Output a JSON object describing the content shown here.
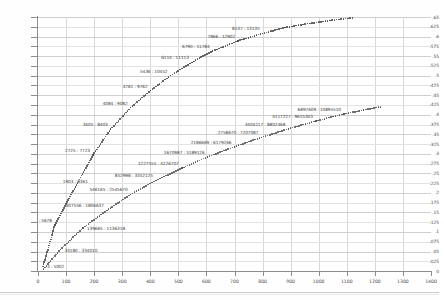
{
  "chart_data": {
    "type": "scatter",
    "title": "",
    "xlabel": "",
    "ylabel": "",
    "xlim": [
      0,
      1400
    ],
    "ylim": [
      0,
      0.65
    ],
    "grid": true,
    "legend": "none",
    "x_ticks": [
      0,
      100,
      200,
      300,
      400,
      500,
      600,
      700,
      800,
      900,
      1000,
      1100,
      1200,
      1300,
      1400
    ],
    "y_ticks": [
      "0",
      ".025",
      ".05",
      ".075",
      ".1",
      ".125",
      ".15",
      ".175",
      ".2",
      ".225",
      ".25",
      ".275",
      ".3",
      ".325",
      ".35",
      ".375",
      ".4",
      ".425",
      ".45",
      ".475",
      ".5",
      ".525",
      ".55",
      ".575",
      ".6",
      ".625",
      ".65"
    ],
    "series": [
      {
        "name": "upper-curve",
        "points": [
          {
            "x": 18,
            "y": 0.012,
            "label": "3 : 5002",
            "pos": "right"
          },
          {
            "x": 60,
            "y": 0.118,
            "label": "680 : 5678",
            "pos": "left"
          },
          {
            "x": 133,
            "y": 0.215,
            "label": "1903 : 8361",
            "pos": "above"
          },
          {
            "x": 196,
            "y": 0.297,
            "label": "2725 : 7723",
            "pos": "left"
          },
          {
            "x": 259,
            "y": 0.363,
            "label": "3405 : 8403",
            "pos": "left"
          },
          {
            "x": 330,
            "y": 0.418,
            "label": "4084 : 9082",
            "pos": "left"
          },
          {
            "x": 401,
            "y": 0.462,
            "label": "4761 : 9762",
            "pos": "left"
          },
          {
            "x": 472,
            "y": 0.5,
            "label": "5436 : 10452",
            "pos": "left"
          },
          {
            "x": 548,
            "y": 0.534,
            "label": "6114 : 11113",
            "pos": "left"
          },
          {
            "x": 622,
            "y": 0.563,
            "label": "6790 : 11784",
            "pos": "left"
          },
          {
            "x": 713,
            "y": 0.589,
            "label": "7966 : 12902",
            "pos": "left"
          },
          {
            "x": 800,
            "y": 0.608,
            "label": "8137 : 13135",
            "pos": "left"
          },
          {
            "x": 880,
            "y": 0.623,
            "label": "",
            "pos": "right"
          },
          {
            "x": 960,
            "y": 0.633,
            "label": "",
            "pos": "right"
          },
          {
            "x": 1040,
            "y": 0.641,
            "label": "",
            "pos": "right"
          },
          {
            "x": 1120,
            "y": 0.648,
            "label": "",
            "pos": "right"
          }
        ]
      },
      {
        "name": "lower-curve",
        "points": [
          {
            "x": 20,
            "y": 0.005,
            "label": "",
            "pos": "right"
          },
          {
            "x": 80,
            "y": 0.055,
            "label": "34180 : 334010",
            "pos": "right"
          },
          {
            "x": 160,
            "y": 0.11,
            "label": "139665 : 1136318",
            "pos": "right"
          },
          {
            "x": 245,
            "y": 0.155,
            "label": "307556 : 1806637",
            "pos": "left"
          },
          {
            "x": 330,
            "y": 0.196,
            "label": "546165 : 2545670",
            "pos": "left"
          },
          {
            "x": 420,
            "y": 0.232,
            "label": "852998 : 3352125",
            "pos": "left"
          },
          {
            "x": 512,
            "y": 0.263,
            "label": "1227555 : 4226707",
            "pos": "left"
          },
          {
            "x": 604,
            "y": 0.292,
            "label": "1670987 : 5189126",
            "pos": "left"
          },
          {
            "x": 700,
            "y": 0.318,
            "label": "2186669 : 6179266",
            "pos": "left"
          },
          {
            "x": 796,
            "y": 0.342,
            "label": "2758670 : 7207087",
            "pos": "left"
          },
          {
            "x": 892,
            "y": 0.364,
            "label": "3404217 : 8802468",
            "pos": "left"
          },
          {
            "x": 990,
            "y": 0.384,
            "label": "4117227 : 9615303",
            "pos": "left"
          },
          {
            "x": 1090,
            "y": 0.402,
            "label": "6897609 : 10895510",
            "pos": "left"
          },
          {
            "x": 1160,
            "y": 0.412,
            "label": "",
            "pos": "right"
          },
          {
            "x": 1220,
            "y": 0.42,
            "label": "",
            "pos": "right"
          }
        ]
      }
    ]
  }
}
